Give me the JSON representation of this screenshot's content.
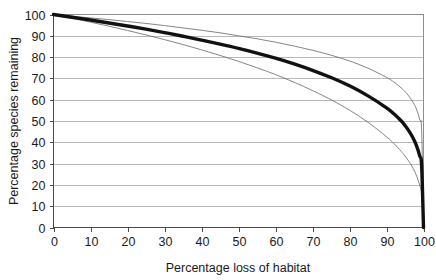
{
  "chart_data": {
    "type": "line",
    "title": "",
    "xlabel": "Percentage loss of habitat",
    "ylabel": "Percentage species remaining",
    "xlim": [
      0,
      100
    ],
    "ylim": [
      0,
      100
    ],
    "xticks": [
      "0",
      "10",
      "20",
      "30",
      "40",
      "50",
      "60",
      "70",
      "80",
      "90",
      "100"
    ],
    "yticks": [
      "0",
      "10",
      "20",
      "30",
      "40",
      "50",
      "60",
      "70",
      "80",
      "90",
      "100"
    ],
    "grid": "horizontal",
    "legend": "none",
    "x": [
      0,
      5,
      10,
      15,
      20,
      25,
      30,
      35,
      40,
      45,
      50,
      55,
      60,
      65,
      70,
      75,
      80,
      85,
      90,
      92,
      94,
      95,
      96,
      97,
      98,
      99,
      99.5,
      100
    ],
    "series": [
      {
        "name": "upper-bound-curve",
        "style": "thin",
        "z": 0.15,
        "values": [
          100,
          99.2,
          98.4,
          97.6,
          96.7,
          95.8,
          94.8,
          93.7,
          92.6,
          91.4,
          90.0,
          88.6,
          87.0,
          85.2,
          83.2,
          80.9,
          78.2,
          74.8,
          70.5,
          68.3,
          65.5,
          63.8,
          61.8,
          59.3,
          56.0,
          50.5,
          45.5,
          0
        ]
      },
      {
        "name": "central-curve",
        "style": "thick",
        "z": 0.25,
        "values": [
          100,
          98.7,
          97.4,
          96.0,
          94.6,
          93.1,
          91.5,
          89.8,
          88.0,
          86.1,
          84.1,
          81.9,
          79.5,
          76.8,
          73.8,
          70.4,
          66.5,
          61.8,
          56.2,
          53.4,
          50.0,
          47.9,
          45.5,
          42.6,
          38.9,
          33.5,
          29.0,
          0
        ]
      },
      {
        "name": "lower-bound-curve",
        "style": "thin",
        "z": 0.35,
        "values": [
          100,
          98.2,
          96.4,
          94.5,
          92.5,
          90.4,
          88.2,
          85.9,
          83.4,
          80.8,
          78.0,
          75.0,
          71.8,
          68.2,
          64.3,
          60.0,
          55.1,
          49.4,
          42.6,
          39.4,
          35.7,
          33.6,
          31.2,
          28.4,
          24.8,
          19.7,
          15.5,
          0
        ]
      }
    ]
  },
  "colors": {
    "curve_thick": "#111111",
    "curve_thin": "#6f6f6f",
    "gridline": "#9a9a9a",
    "axis": "#4a4a4a",
    "frame": "#8d8d8d",
    "text": "#1a1a1a",
    "background": "#ffffff"
  }
}
